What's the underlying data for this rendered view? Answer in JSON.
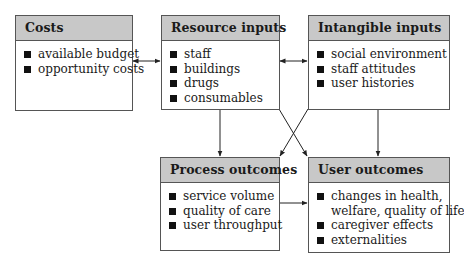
{
  "diagram": {
    "boxes": {
      "costs": {
        "title": "Costs",
        "items": [
          "available budget",
          "opportunity costs"
        ]
      },
      "resource_inputs": {
        "title": "Resource inputs",
        "items": [
          "staff",
          "buildings",
          "drugs",
          "consumables"
        ]
      },
      "intangible_inputs": {
        "title": "Intangible inputs",
        "items": [
          "social environment",
          "staff attitudes",
          "user histories"
        ]
      },
      "process_outcomes": {
        "title": "Process outcomes",
        "items": [
          "service volume",
          "quality of care",
          "user throughput"
        ]
      },
      "user_outcomes": {
        "title": "User outcomes",
        "items": [
          "changes in health,",
          "welfare, quality of life",
          "caregiver effects",
          "externalities"
        ]
      }
    },
    "connections": [
      {
        "from": "Costs",
        "to": "Resource inputs",
        "type": "bidirectional"
      },
      {
        "from": "Resource inputs",
        "to": "Intangible inputs",
        "type": "bidirectional"
      },
      {
        "from": "Resource inputs",
        "to": "Process outcomes",
        "type": "directed"
      },
      {
        "from": "Resource inputs",
        "to": "User outcomes",
        "type": "directed"
      },
      {
        "from": "Intangible inputs",
        "to": "Process outcomes",
        "type": "directed"
      },
      {
        "from": "Intangible inputs",
        "to": "User outcomes",
        "type": "directed"
      },
      {
        "from": "Process outcomes",
        "to": "User outcomes",
        "type": "directed"
      }
    ],
    "colors": {
      "header_fill": "#c8c8c8",
      "border": "#555555",
      "bullet": "#111111"
    }
  }
}
